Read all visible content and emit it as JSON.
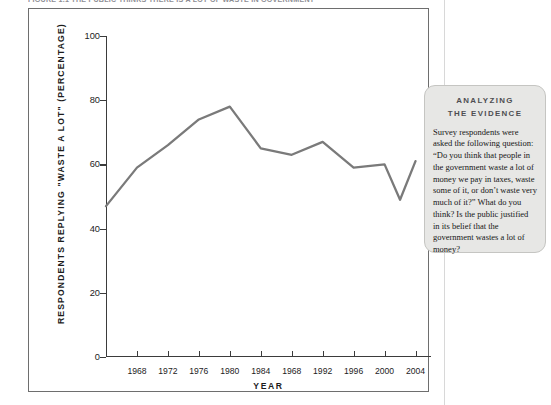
{
  "figure": {
    "caption": "FIGURE 1.1   THE PUBLIC THINKS THERE IS A LOT OF WASTE IN GOVERNMENT"
  },
  "sidebar": {
    "heading_line1": "ANALYZING",
    "heading_line2": "THE EVIDENCE",
    "body": "Survey respondents were asked the following question: “Do you think that people in the government waste a lot of money we pay in taxes, waste some of it, or don’t waste very much of it?” What do you think? Is the public justified in its belief that the government wastes a lot of money?"
  },
  "colors": {
    "line": "#7a7a7a",
    "axis": "#3b3b3b",
    "frame": "#6e6e6e",
    "sidebar_bg": "#e7e7e5",
    "sidebar_border": "#c5c5c2",
    "caption": "#8e8e94",
    "page_rule": "#d8d8d8"
  },
  "chart_data": {
    "type": "line",
    "title": "THE PUBLIC THINKS THERE IS A LOT OF WASTE IN GOVERNMENT",
    "xlabel": "YEAR",
    "ylabel": "RESPONDENTS REPLYING \"WASTE A LOT\" (PERCENTAGE)",
    "xlim": [
      1964,
      2006
    ],
    "ylim": [
      0,
      100
    ],
    "yticks": [
      0,
      20,
      40,
      60,
      80,
      100
    ],
    "ytick_labels": [
      "0",
      "20",
      "40",
      "60",
      "80",
      "100"
    ],
    "xticks": [
      1968,
      1972,
      1976,
      1980,
      1984,
      1988,
      1992,
      1996,
      2000,
      2004
    ],
    "xtick_labels": [
      "1968",
      "1972",
      "1976",
      "1980",
      "1984",
      "1968",
      "1992",
      "1996",
      "2000",
      "2004"
    ],
    "grid": false,
    "legend": "none",
    "x": [
      1964,
      1968,
      1972,
      1976,
      1980,
      1984,
      1988,
      1992,
      1996,
      2000,
      2002,
      2004
    ],
    "values": [
      47,
      59,
      66,
      74,
      78,
      65,
      63,
      67,
      59,
      60,
      49,
      61
    ],
    "series": [
      {
        "name": "Respondents replying \"waste a lot\"",
        "values": [
          47,
          59,
          66,
          74,
          78,
          65,
          63,
          67,
          59,
          60,
          49,
          61
        ]
      }
    ]
  }
}
